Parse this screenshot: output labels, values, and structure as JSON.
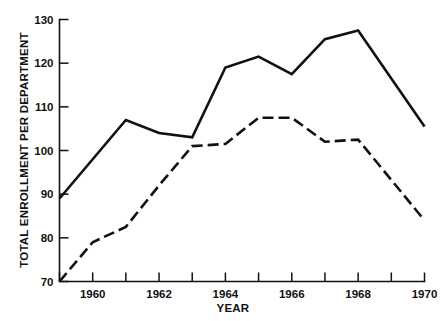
{
  "chart_data": {
    "type": "line",
    "title": "",
    "subtitle": "",
    "xlabel": "YEAR",
    "ylabel": "TOTAL ENROLLMENT PER DEPARTMENT",
    "xlim": [
      1959,
      1970
    ],
    "ylim": [
      70,
      130
    ],
    "grid": false,
    "legend": null,
    "x": [
      1959,
      1960,
      1961,
      1962,
      1963,
      1964,
      1965,
      1966,
      1967,
      1968,
      1970
    ],
    "xticks": [
      1959,
      1960,
      1961,
      1962,
      1963,
      1964,
      1965,
      1966,
      1967,
      1968,
      1969,
      1970
    ],
    "xticklabels": [
      "",
      "1960",
      "",
      "1962",
      "",
      "1964",
      "",
      "1966",
      "",
      "1968",
      "",
      "1970"
    ],
    "yticks": [
      70,
      80,
      90,
      100,
      110,
      120,
      130
    ],
    "yticklabels": [
      "70",
      "80",
      "90",
      "100",
      "110",
      "120",
      "130"
    ],
    "series": [
      {
        "name": "solid-series",
        "style": "solid",
        "color": "#111111",
        "values": [
          89,
          98,
          107,
          104,
          103,
          119,
          121.5,
          117.5,
          125.5,
          127.5,
          105.5
        ]
      },
      {
        "name": "dashed-series",
        "style": "dashed",
        "color": "#111111",
        "values": [
          70,
          79,
          82.5,
          92,
          101,
          101.5,
          107.5,
          107.5,
          102,
          102.5,
          84
        ]
      }
    ]
  },
  "figure": {
    "background_color": "#ffffff",
    "axis_color": "#111111"
  }
}
